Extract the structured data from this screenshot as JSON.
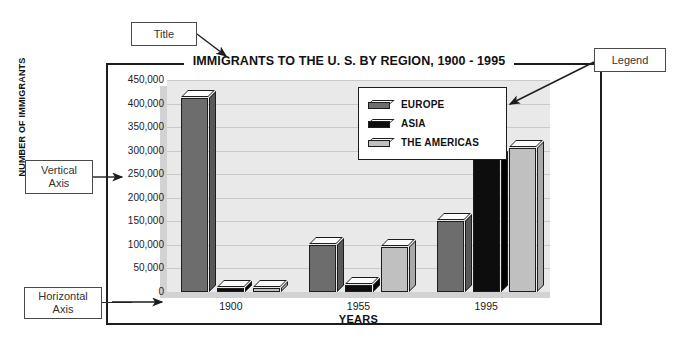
{
  "chart_data": {
    "type": "bar",
    "title": "IMMIGRANTS TO THE U. S. BY REGION, 1900 - 1995",
    "xlabel": "YEARS",
    "ylabel": "NUMBER OF IMMIGRANTS",
    "categories": [
      "1900",
      "1955",
      "1995"
    ],
    "series": [
      {
        "name": "EUROPE",
        "values": [
          412000,
          100000,
          150000
        ],
        "color": "#6d6d6d"
      },
      {
        "name": "ASIA",
        "values": [
          5000,
          15000,
          285000
        ],
        "color": "#0d0d0d"
      },
      {
        "name": "THE AMERICAS",
        "values": [
          7000,
          95000,
          305000
        ],
        "color": "#c0c0c0"
      }
    ],
    "ylim": [
      0,
      450000
    ],
    "ytick_labels": [
      "450,000",
      "400,000",
      "350,000",
      "300,000",
      "250,000",
      "200,000",
      "150,000",
      "100,000",
      "50,000",
      "0"
    ],
    "ytick_values": [
      450000,
      400000,
      350000,
      300000,
      250000,
      200000,
      150000,
      100000,
      50000,
      0
    ],
    "grid": true,
    "legend_position": "inside-top-right",
    "plot_background": "#e9e9e9"
  },
  "annotations": {
    "title_callout": "Title",
    "legend_callout": "Legend",
    "vertical_axis_callout": "Vertical\nAxis",
    "horizontal_axis_callout": "Horizontal\nAxis"
  }
}
